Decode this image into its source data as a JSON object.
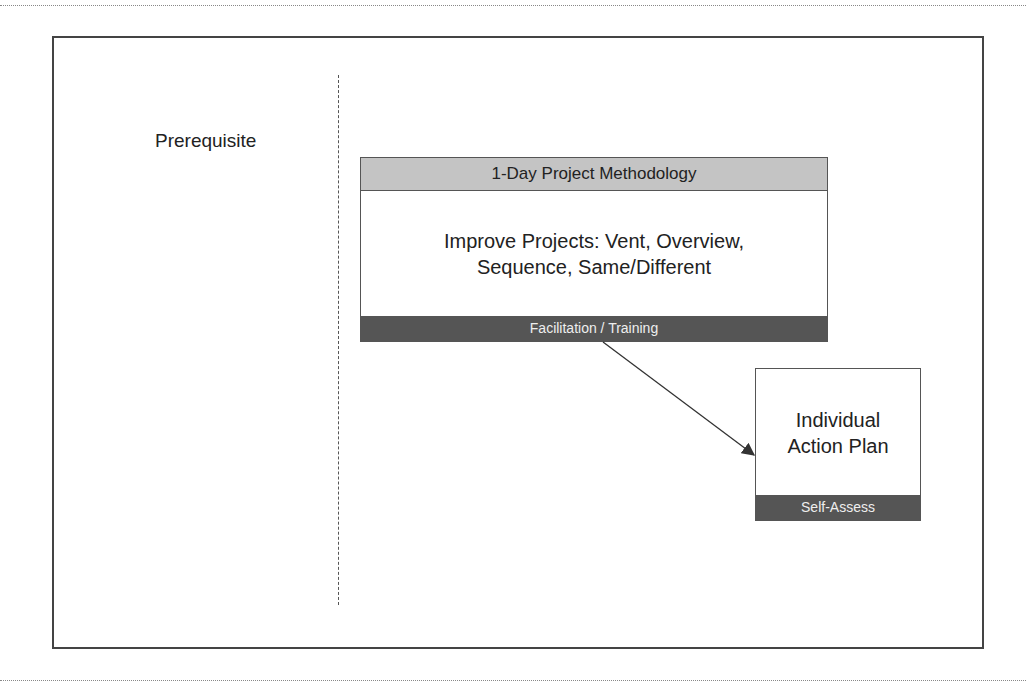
{
  "diagram": {
    "left_label": "Prerequisite",
    "main_box": {
      "header": "1-Day Project Methodology",
      "body_line1": "Improve Projects: Vent, Overview,",
      "body_line2": "Sequence, Same/Different",
      "footer": "Facilitation / Training"
    },
    "plan_box": {
      "body_line1": "Individual",
      "body_line2": "Action Plan",
      "footer": "Self-Assess"
    },
    "connector": {
      "from": "Facilitation / Training",
      "to": "Individual Action Plan"
    },
    "colors": {
      "header_fill": "#c4c4c4",
      "footer_fill": "#555555",
      "border": "#444444"
    }
  }
}
